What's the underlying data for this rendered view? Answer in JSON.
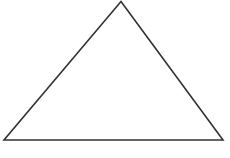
{
  "figure": {
    "type": "line-drawing",
    "shape_name": "triangle",
    "caption": "",
    "background_color": "#ffffff",
    "stroke_color": "#333333",
    "fill_color": "none",
    "stroke_width": 1.6,
    "canvas": {
      "width": 230,
      "height": 158
    },
    "vertices": [
      {
        "label": "apex",
        "x": 121,
        "y": 1.5
      },
      {
        "label": "bottom-right",
        "x": 223,
        "y": 140
      },
      {
        "label": "bottom-left",
        "x": 4,
        "y": 140
      }
    ],
    "edges": [
      {
        "name": "left-edge",
        "from": "bottom-left",
        "to": "apex"
      },
      {
        "name": "right-edge",
        "from": "apex",
        "to": "bottom-right"
      },
      {
        "name": "base-edge",
        "from": "bottom-right",
        "to": "bottom-left"
      }
    ],
    "polygon_points": "121,1.5 223,140 4,140",
    "vertex_labels": [],
    "side_labels": [],
    "angle_labels": []
  }
}
